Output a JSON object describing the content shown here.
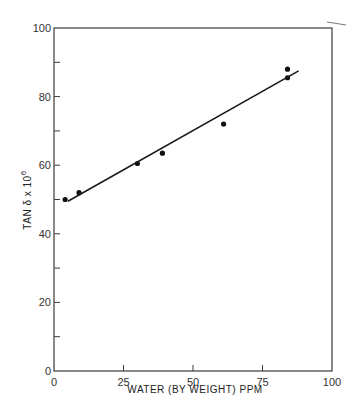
{
  "chart_data": {
    "type": "scatter",
    "title": "",
    "xlabel": "WATER (BY WEIGHT) PPM",
    "ylabel": "TAN δ x 10⁶",
    "ylabel_main": "TAN δ x 10",
    "ylabel_sup": "6",
    "xlim": [
      0,
      100
    ],
    "ylim": [
      0,
      100
    ],
    "x_ticks": [
      0,
      25,
      50,
      75,
      100
    ],
    "x_tick_labels": [
      "0",
      "25",
      "50",
      "75",
      "100"
    ],
    "y_ticks": [
      0,
      20,
      40,
      60,
      80,
      100
    ],
    "y_tick_labels": [
      "0",
      "20",
      "40",
      "60",
      "80",
      "100"
    ],
    "y_minor_ticks": [
      10,
      30,
      50,
      70,
      90
    ],
    "x_minor_ticks": [],
    "grid": false,
    "legend": null,
    "series": [
      {
        "name": "measured",
        "type": "scatter",
        "x": [
          4,
          9,
          30,
          39,
          61,
          84,
          84
        ],
        "y": [
          50,
          52,
          60.5,
          63.5,
          72,
          88,
          85.5
        ]
      },
      {
        "name": "linear fit",
        "type": "line",
        "x": [
          5,
          88
        ],
        "y": [
          49.5,
          87.5
        ]
      }
    ]
  }
}
